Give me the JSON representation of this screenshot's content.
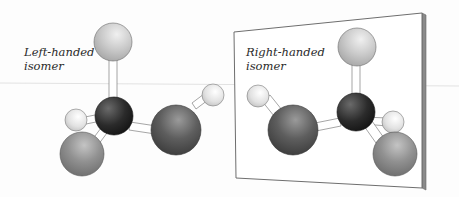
{
  "figure": {
    "left_molecule": {
      "label_line1": "Left-handed",
      "label_line2": "isomer"
    },
    "right_molecule": {
      "label_line1": "Right-handed",
      "label_line2": "isomer"
    },
    "colors": {
      "background": "#fdfdfd",
      "mirror_face": "#ffffff",
      "mirror_edge": "#777777",
      "mirror_side": "#8a8a8a",
      "central_atom": "#2b2b2b",
      "large_dark_atom": "#5a5a5a",
      "medium_gray_atom": "#8e8e8e",
      "light_top_atom": "#c8c8c8",
      "small_white_atom": "#e4e4e4",
      "bond": "#ffffff"
    }
  }
}
